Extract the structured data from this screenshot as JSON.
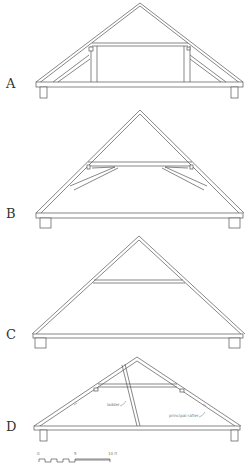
{
  "figure": {
    "panels": [
      {
        "id": "A",
        "label": "A",
        "description": "Roof truss with collar beam, queen posts and struts"
      },
      {
        "id": "B",
        "label": "B",
        "description": "Roof truss with collar beam and curved braces"
      },
      {
        "id": "C",
        "label": "C",
        "description": "Roof truss with collar beam only"
      },
      {
        "id": "D",
        "label": "D",
        "description": "Roof truss with collar beam and ladder"
      }
    ],
    "annotations": {
      "ladder": "ladder",
      "principal_rafter": "principal rafter"
    },
    "scale_bar": {
      "ticks": [
        "0",
        "5",
        "10 ft"
      ],
      "unit": "ft"
    }
  }
}
